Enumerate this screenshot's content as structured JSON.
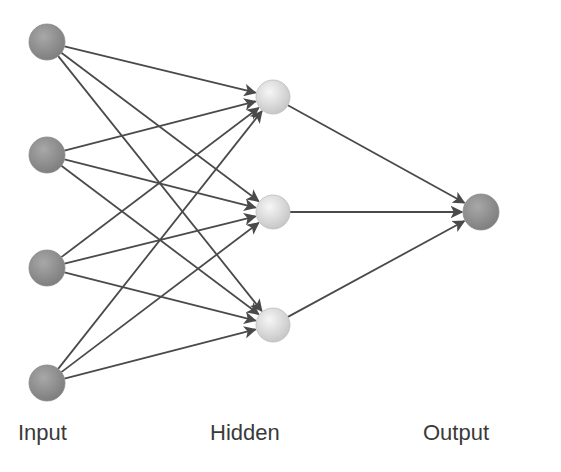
{
  "diagram": {
    "colors": {
      "edge": "#4a4a4a",
      "input_node": "#8e8e8e",
      "hidden_node": "#e2e2e2",
      "output_node": "#8e8e8e",
      "label": "#3a3a3a"
    },
    "layers": [
      {
        "name": "input",
        "label": "Input",
        "label_x": 18,
        "nodes": [
          {
            "id": "i1",
            "x": 47,
            "y": 42,
            "r": 18
          },
          {
            "id": "i2",
            "x": 47,
            "y": 155,
            "r": 18
          },
          {
            "id": "i3",
            "x": 47,
            "y": 268,
            "r": 18
          },
          {
            "id": "i4",
            "x": 47,
            "y": 383,
            "r": 18
          }
        ]
      },
      {
        "name": "hidden",
        "label": "Hidden",
        "label_x": 210,
        "nodes": [
          {
            "id": "h1",
            "x": 273,
            "y": 97,
            "r": 17
          },
          {
            "id": "h2",
            "x": 273,
            "y": 212,
            "r": 17
          },
          {
            "id": "h3",
            "x": 273,
            "y": 325,
            "r": 17
          }
        ]
      },
      {
        "name": "output",
        "label": "Output",
        "label_x": 423,
        "nodes": [
          {
            "id": "o1",
            "x": 481,
            "y": 212,
            "r": 18
          }
        ]
      }
    ],
    "edges": [
      [
        "i1",
        "h1"
      ],
      [
        "i1",
        "h2"
      ],
      [
        "i1",
        "h3"
      ],
      [
        "i2",
        "h1"
      ],
      [
        "i2",
        "h2"
      ],
      [
        "i2",
        "h3"
      ],
      [
        "i3",
        "h1"
      ],
      [
        "i3",
        "h2"
      ],
      [
        "i3",
        "h3"
      ],
      [
        "i4",
        "h1"
      ],
      [
        "i4",
        "h2"
      ],
      [
        "i4",
        "h3"
      ],
      [
        "h1",
        "o1"
      ],
      [
        "h2",
        "o1"
      ],
      [
        "h3",
        "o1"
      ]
    ]
  },
  "labels": {
    "input": "Input",
    "hidden": "Hidden",
    "output": "Output"
  }
}
